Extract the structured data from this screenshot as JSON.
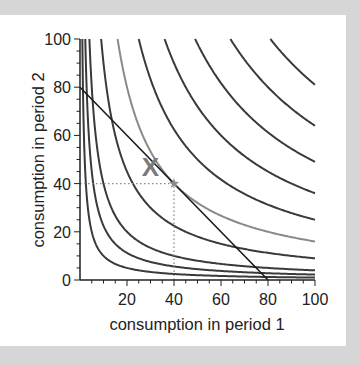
{
  "chart_data": {
    "type": "line",
    "title": "",
    "xlabel": "consumption in period 1",
    "ylabel": "consumption in period 2",
    "xlim": [
      0,
      100
    ],
    "ylim": [
      0,
      100
    ],
    "x_ticks": [
      20,
      40,
      60,
      80,
      100
    ],
    "y_ticks": [
      0,
      20,
      40,
      60,
      80,
      100
    ],
    "grid": false,
    "legend": null,
    "indifference_curves": {
      "form": "c1 * c2 = k",
      "levels": [
        100,
        225,
        400,
        900,
        1600,
        2500,
        3600,
        4900,
        6400,
        8100
      ],
      "highlighted_level": 1600,
      "color": "#3a3a3a",
      "highlight_color": "#8a8a8a"
    },
    "budget_line": {
      "points": [
        [
          0,
          80
        ],
        [
          80,
          0
        ]
      ],
      "color": "#1a1a1a"
    },
    "markers": [
      {
        "name": "X",
        "label": "X",
        "x": 30,
        "y": 47,
        "color": "#7a7a7a"
      },
      {
        "name": "optimum",
        "label": "*",
        "x": 40,
        "y": 40,
        "color": "#8a8a8a"
      }
    ],
    "guides": [
      {
        "from": [
          0,
          40
        ],
        "to": [
          40,
          40
        ],
        "style": "dotted"
      },
      {
        "from": [
          40,
          0
        ],
        "to": [
          40,
          40
        ],
        "style": "dotted"
      }
    ]
  },
  "labels": {
    "x_axis": "consumption in period 1",
    "y_axis": "consumption in period 2",
    "x_marker": "X"
  }
}
